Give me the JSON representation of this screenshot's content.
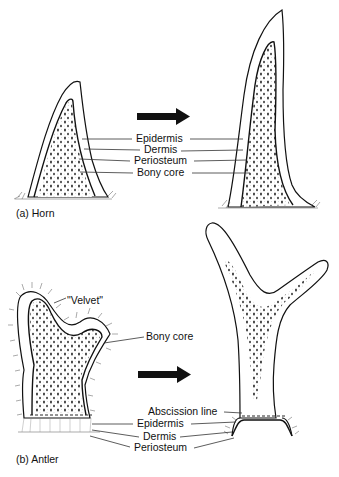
{
  "figure": {
    "panel_a": {
      "caption": "(a) Horn",
      "labels": [
        "Epidermis",
        "Dermis",
        "Periosteum",
        "Bony core"
      ],
      "arrow": "right-arrow"
    },
    "panel_b": {
      "caption": "(b) Antler",
      "labels_left": [
        "\"Velvet\"",
        "Bony core"
      ],
      "labels_bottom": [
        "Abscission line",
        "Epidermis",
        "Dermis",
        "Periosteum"
      ],
      "arrow": "right-arrow"
    },
    "colors": {
      "ink": "#111111",
      "background": "#ffffff"
    }
  }
}
